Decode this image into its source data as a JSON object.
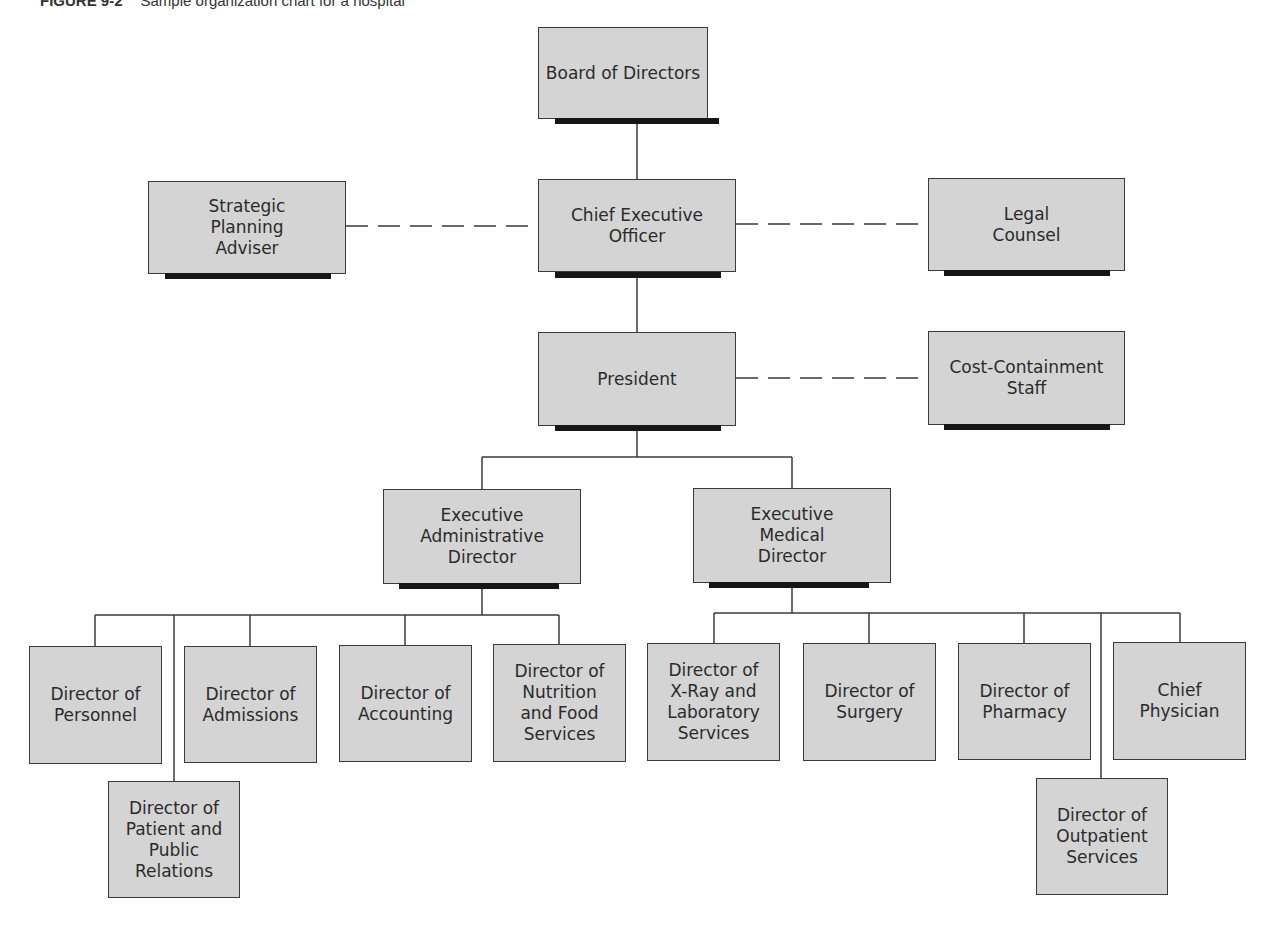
{
  "caption": {
    "label": "FIGURE 9-2",
    "text": "Sample organization chart for a hospital"
  },
  "nodes": {
    "board": "Board of Directors",
    "strategic": "Strategic\nPlanning\nAdviser",
    "ceo": "Chief Executive\nOfficer",
    "legal": "Legal\nCounsel",
    "president": "President",
    "cost": "Cost-Containment\nStaff",
    "exec_admin": "Executive\nAdministrative\nDirector",
    "exec_medical": "Executive\nMedical\nDirector",
    "personnel": "Director of\nPersonnel",
    "patient_relations": "Director of\nPatient and\nPublic\nRelations",
    "admissions": "Director of\nAdmissions",
    "accounting": "Director of\nAccounting",
    "nutrition": "Director of\nNutrition\nand Food\nServices",
    "xray": "Director of\nX-Ray and\nLaboratory\nServices",
    "surgery": "Director of\nSurgery",
    "pharmacy": "Director of\nPharmacy",
    "chief_physician": "Chief\nPhysician",
    "outpatient": "Director of\nOutpatient\nServices"
  },
  "relationships": {
    "solid": [
      [
        "board",
        "ceo"
      ],
      [
        "ceo",
        "president"
      ],
      [
        "president",
        "exec_admin"
      ],
      [
        "president",
        "exec_medical"
      ],
      [
        "exec_admin",
        "personnel"
      ],
      [
        "exec_admin",
        "patient_relations"
      ],
      [
        "exec_admin",
        "admissions"
      ],
      [
        "exec_admin",
        "accounting"
      ],
      [
        "exec_admin",
        "nutrition"
      ],
      [
        "exec_medical",
        "xray"
      ],
      [
        "exec_medical",
        "surgery"
      ],
      [
        "exec_medical",
        "pharmacy"
      ],
      [
        "exec_medical",
        "outpatient"
      ],
      [
        "exec_medical",
        "chief_physician"
      ]
    ],
    "dashed_advisory": [
      [
        "strategic",
        "ceo"
      ],
      [
        "ceo",
        "legal"
      ],
      [
        "president",
        "cost"
      ]
    ]
  },
  "colors": {
    "box_fill": "#d4d4d4",
    "box_border": "#3a3a3a",
    "shadow": "#161616",
    "line": "#3a3a3a"
  }
}
